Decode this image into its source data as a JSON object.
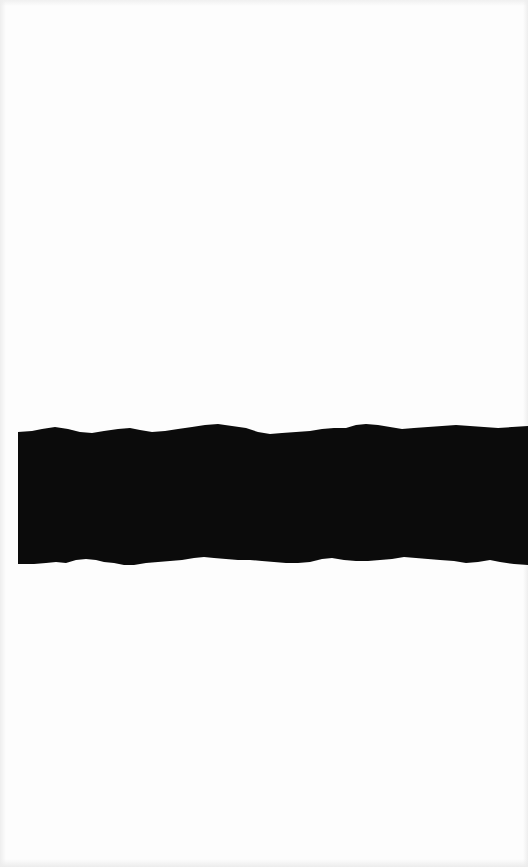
{
  "document": {
    "type": "scanned-page",
    "background_color": "#fdfdfd",
    "visible_text": ""
  },
  "redaction_band": {
    "color": "#0b0b0b",
    "left": 18,
    "right": 528,
    "top_edge_y_range": [
      423,
      434
    ],
    "bottom_edge_y_range": [
      556,
      566
    ],
    "label": ""
  }
}
